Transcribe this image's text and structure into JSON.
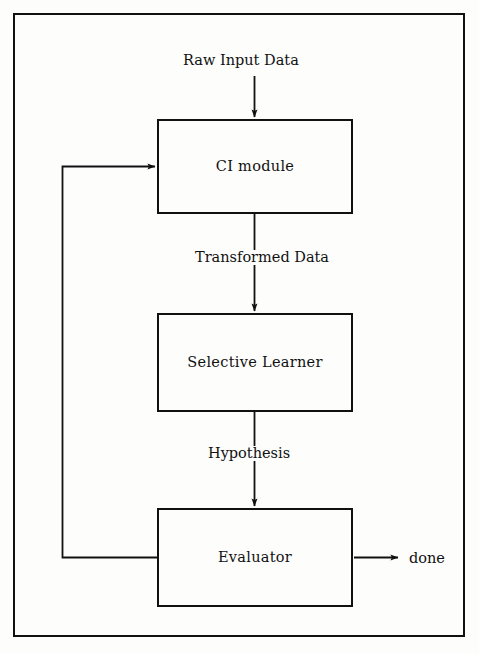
{
  "figure": {
    "frame": {
      "visible": true,
      "color": "#111111"
    },
    "background_color": "#fdfdfc",
    "line_color": "#111111"
  },
  "nodes": [
    {
      "id": "ci_module",
      "label": "CI module"
    },
    {
      "id": "selective_learner",
      "label": "Selective Learner"
    },
    {
      "id": "evaluator",
      "label": "Evaluator"
    }
  ],
  "edge_labels": {
    "raw_input": "Raw Input Data",
    "transformed": "Transformed Data",
    "hypothesis": "Hypothesis",
    "done": "done"
  },
  "edges": [
    {
      "from": "raw_input",
      "to": "ci_module",
      "label": "Raw Input Data",
      "arrow": true,
      "direction": "down"
    },
    {
      "from": "ci_module",
      "to": "selective_learner",
      "label": "Transformed Data",
      "arrow": true,
      "direction": "down"
    },
    {
      "from": "selective_learner",
      "to": "evaluator",
      "label": "Hypothesis",
      "arrow": true,
      "direction": "down"
    },
    {
      "from": "evaluator",
      "to": "done",
      "label": "done",
      "arrow": true,
      "direction": "right"
    },
    {
      "from": "evaluator",
      "to": "ci_module",
      "label": "",
      "arrow": true,
      "direction": "feedback-left-up"
    }
  ]
}
